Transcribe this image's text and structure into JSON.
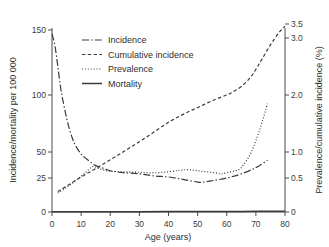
{
  "chart_data": {
    "type": "line",
    "title": "",
    "xlabel": "Age (years)",
    "ylabel": "Incidence/mortality per 100 000",
    "ylabel_right": "Prevalence/cumulative incidence (%)",
    "xlim": [
      0,
      80
    ],
    "xticks": [
      0,
      10,
      20,
      30,
      40,
      50,
      60,
      70,
      80
    ],
    "xticklabels": [
      "0",
      "10",
      "20",
      "30",
      "40",
      "50",
      "60",
      "70",
      "80"
    ],
    "left_axis": {
      "label": "Incidence/mortality per 100 000",
      "ticks": [
        0,
        25,
        50,
        100,
        150
      ],
      "ticklabels": [
        "0",
        "25",
        "50",
        "100",
        "150"
      ],
      "scale": "nonlinear-sqrt",
      "lim": [
        0,
        150
      ]
    },
    "right_axis": {
      "label": "Prevalence/cumulative incidence (%)",
      "ticks": [
        0,
        0.5,
        1.0,
        2.0,
        3.0,
        3.5
      ],
      "ticklabels": [
        "0",
        "0.5",
        "1.0",
        "2.0",
        "3.0",
        "3.5"
      ],
      "scale": "nonlinear-sqrt",
      "lim": [
        0,
        3.5
      ]
    },
    "grid": false,
    "legend_position": "upper-center",
    "series": [
      {
        "name": "Incidence",
        "axis": "left",
        "unit": "per 100 000",
        "style": "dash-dot",
        "x": [
          0,
          1,
          2,
          3,
          4,
          5,
          6,
          7,
          8,
          10,
          12,
          15,
          18,
          20,
          22,
          25,
          30,
          35,
          40,
          45,
          50,
          52,
          55,
          60,
          65,
          70,
          74
        ],
        "values": [
          147,
          138,
          122,
          105,
          92,
          80,
          70,
          62,
          56,
          48,
          43,
          37,
          34,
          32,
          31,
          30,
          29,
          27,
          26,
          24,
          22,
          22,
          23,
          25,
          29,
          35,
          42
        ]
      },
      {
        "name": "Cumulative incidence",
        "axis": "right",
        "unit": "%",
        "style": "dashed",
        "x": [
          2,
          5,
          10,
          15,
          20,
          25,
          30,
          35,
          40,
          45,
          50,
          55,
          60,
          62,
          65,
          68,
          70,
          72,
          75,
          78,
          80
        ],
        "values": [
          0.3,
          0.38,
          0.52,
          0.68,
          0.85,
          1.02,
          1.18,
          1.35,
          1.52,
          1.66,
          1.78,
          1.9,
          2.0,
          2.05,
          2.15,
          2.3,
          2.45,
          2.62,
          2.88,
          3.2,
          3.42
        ]
      },
      {
        "name": "Prevalence",
        "axis": "right",
        "unit": "%",
        "style": "dotted",
        "x": [
          2,
          5,
          8,
          11,
          14,
          16,
          18,
          20,
          25,
          30,
          35,
          40,
          44,
          47,
          50,
          53,
          56,
          58,
          60,
          63,
          65,
          68,
          70,
          72,
          74
        ],
        "values": [
          0.28,
          0.36,
          0.46,
          0.58,
          0.72,
          0.68,
          0.65,
          0.63,
          0.62,
          0.61,
          0.6,
          0.62,
          0.65,
          0.66,
          0.64,
          0.62,
          0.6,
          0.58,
          0.6,
          0.64,
          0.7,
          0.95,
          1.2,
          1.5,
          1.85
        ]
      },
      {
        "name": "Mortality",
        "axis": "left",
        "unit": "per 100 000",
        "style": "solid",
        "x": [
          0,
          10,
          20,
          30,
          40,
          50,
          60,
          70,
          80
        ],
        "values": [
          0.2,
          0.2,
          0.2,
          0.2,
          0.3,
          0.3,
          0.4,
          0.5,
          0.6
        ]
      }
    ],
    "legend": [
      {
        "label": "Incidence",
        "style": "dash-dot"
      },
      {
        "label": "Cumulative incidence",
        "style": "dashed"
      },
      {
        "label": "Prevalence",
        "style": "dotted"
      },
      {
        "label": "Mortality",
        "style": "solid"
      }
    ],
    "colors": {
      "axis": "#4a4a4a",
      "series": "#3a3a3a",
      "text": "#2e2e2e",
      "background": "#ffffff"
    }
  }
}
